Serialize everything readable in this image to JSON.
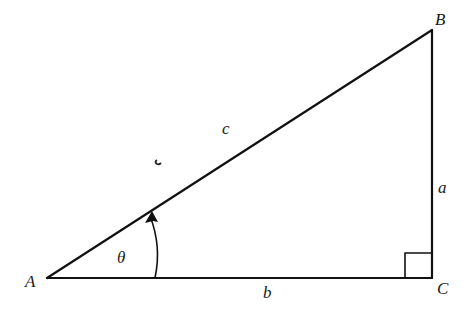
{
  "diagram": {
    "type": "right-triangle",
    "vertices": {
      "A": {
        "label": "A",
        "x": 47,
        "y": 278
      },
      "B": {
        "label": "B",
        "x": 432,
        "y": 30
      },
      "C": {
        "label": "C",
        "x": 432,
        "y": 278
      }
    },
    "sides": {
      "a": {
        "label": "a",
        "from": "B",
        "to": "C"
      },
      "b": {
        "label": "b",
        "from": "A",
        "to": "C"
      },
      "c": {
        "label": "c",
        "from": "A",
        "to": "B"
      }
    },
    "angle": {
      "label": "θ",
      "vertex": "A",
      "arrow": "counterclockwise"
    },
    "right_angle_marker": {
      "vertex": "C"
    },
    "colors": {
      "stroke": "#111111",
      "background": "#ffffff"
    }
  }
}
